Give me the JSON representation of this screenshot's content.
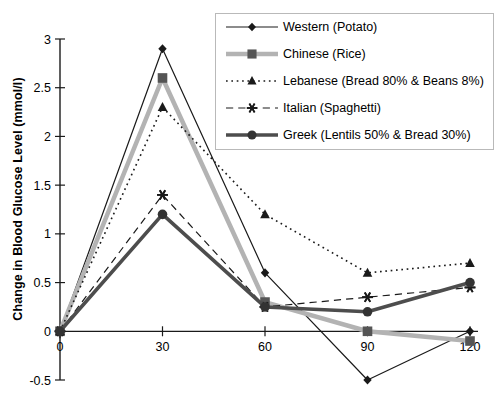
{
  "chart_data": {
    "type": "line",
    "title": "",
    "xlabel": "",
    "ylabel": "Change in Blood Glucose Level (mmol/l)",
    "x": [
      0,
      30,
      60,
      90,
      120
    ],
    "xtick_labels": [
      "0",
      "30",
      "60",
      "90",
      "120"
    ],
    "ytick_labels": [
      "-0.5",
      "0",
      "0.5",
      "1",
      "1.5",
      "2",
      "2.5",
      "3"
    ],
    "yticks": [
      -0.5,
      0,
      0.5,
      1,
      1.5,
      2,
      2.5,
      3
    ],
    "xlim": [
      0,
      120
    ],
    "ylim": [
      -0.5,
      3
    ],
    "grid": false,
    "legend_position": "top-right",
    "series": [
      {
        "name": "Western (Potato)",
        "marker": "diamond",
        "line_style": "solid",
        "color": "#1a1a1a",
        "line_width": 1.2,
        "values": [
          0,
          2.9,
          0.6,
          -0.5,
          0.0
        ]
      },
      {
        "name": "Chinese (Rice)",
        "marker": "square",
        "line_style": "solid",
        "color": "#b3b3b3",
        "line_width": 4.5,
        "values": [
          0,
          2.6,
          0.3,
          0.0,
          -0.1
        ]
      },
      {
        "name": "Lebanese (Bread 80% & Beans 8%)",
        "marker": "triangle",
        "line_style": "dotted",
        "color": "#1a1a1a",
        "line_width": 1.6,
        "values": [
          0,
          2.3,
          1.2,
          0.6,
          0.7
        ]
      },
      {
        "name": "Italian (Spaghetti)",
        "marker": "asterisk",
        "line_style": "dashed",
        "color": "#1a1a1a",
        "line_width": 1.2,
        "values": [
          0,
          1.4,
          0.25,
          0.35,
          0.45
        ]
      },
      {
        "name": "Greek (Lentils 50% & Bread 30%)",
        "marker": "circle",
        "line_style": "solid",
        "color": "#4d4d4d",
        "line_width": 3.6,
        "values": [
          0,
          1.2,
          0.25,
          0.2,
          0.5
        ]
      }
    ]
  }
}
